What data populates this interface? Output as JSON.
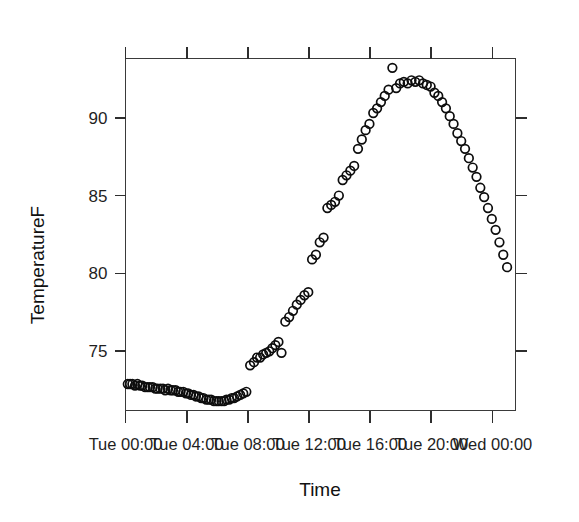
{
  "chart_data": {
    "type": "scatter",
    "title": "",
    "xlabel": "Time",
    "ylabel": "TemperatureF",
    "grid": false,
    "legend": null,
    "marker": "open-circle",
    "xlim": [
      0,
      25.5
    ],
    "ylim": [
      71.2,
      93.8
    ],
    "ytick_values": [
      75,
      80,
      85,
      90
    ],
    "ytick_labels": [
      "75",
      "80",
      "85",
      "90"
    ],
    "xtick_values": [
      0,
      4,
      8,
      12,
      16,
      20,
      24
    ],
    "xtick_labels": [
      "Tue 00:00",
      "Tue 04:00",
      "Tue 08:00",
      "Tue 12:00",
      "Tue 16:00",
      "Tue 20:00",
      "Wed 00:00"
    ],
    "x_units": "hours since Tue 00:00",
    "y_units": "degrees Fahrenheit",
    "x": [
      0.15,
      0.3,
      0.45,
      0.62,
      0.78,
      0.95,
      1.1,
      1.28,
      1.45,
      1.6,
      1.78,
      1.95,
      2.1,
      2.28,
      2.45,
      2.6,
      2.78,
      2.95,
      3.1,
      3.28,
      3.45,
      3.6,
      3.78,
      3.95,
      4.1,
      4.28,
      4.45,
      4.6,
      4.78,
      4.95,
      5.1,
      5.28,
      5.45,
      5.6,
      5.78,
      5.95,
      6.1,
      6.28,
      6.45,
      6.6,
      6.78,
      6.95,
      7.1,
      7.3,
      7.5,
      7.7,
      7.9,
      8.15,
      8.4,
      8.6,
      8.8,
      9.0,
      9.2,
      9.4,
      9.6,
      9.8,
      10.0,
      10.2,
      10.45,
      10.7,
      10.95,
      11.2,
      11.45,
      11.7,
      11.95,
      12.2,
      12.45,
      12.7,
      12.95,
      13.2,
      13.45,
      13.7,
      13.95,
      14.2,
      14.45,
      14.7,
      14.95,
      15.2,
      15.45,
      15.7,
      15.95,
      16.2,
      16.45,
      16.7,
      16.95,
      17.2,
      17.45,
      17.7,
      17.95,
      18.2,
      18.45,
      18.7,
      18.95,
      19.2,
      19.45,
      19.7,
      19.95,
      20.2,
      20.45,
      20.7,
      20.95,
      21.2,
      21.45,
      21.7,
      21.95,
      22.2,
      22.45,
      22.7,
      22.95,
      23.2,
      23.45,
      23.7,
      23.95,
      24.2,
      24.45,
      24.7,
      24.95
    ],
    "y": [
      72.9,
      72.9,
      72.9,
      72.8,
      72.9,
      72.8,
      72.8,
      72.7,
      72.7,
      72.7,
      72.7,
      72.6,
      72.6,
      72.6,
      72.6,
      72.5,
      72.6,
      72.5,
      72.5,
      72.5,
      72.4,
      72.4,
      72.4,
      72.3,
      72.3,
      72.2,
      72.2,
      72.1,
      72.1,
      72.0,
      72.0,
      71.9,
      71.9,
      71.9,
      71.8,
      71.8,
      71.8,
      71.8,
      71.8,
      71.9,
      71.9,
      72.0,
      72.0,
      72.1,
      72.2,
      72.3,
      72.4,
      74.1,
      74.3,
      74.6,
      74.6,
      74.8,
      74.9,
      75.0,
      75.2,
      75.4,
      75.6,
      74.9,
      76.9,
      77.2,
      77.6,
      78.0,
      78.3,
      78.6,
      78.8,
      80.9,
      81.2,
      82.0,
      82.3,
      84.2,
      84.4,
      84.6,
      85.0,
      86.0,
      86.3,
      86.6,
      86.9,
      88.0,
      88.6,
      89.2,
      89.6,
      90.3,
      90.6,
      91.0,
      91.4,
      91.8,
      93.2,
      91.9,
      92.2,
      92.3,
      92.2,
      92.4,
      92.3,
      92.4,
      92.2,
      92.1,
      92.0,
      91.6,
      91.4,
      91.0,
      90.6,
      90.1,
      89.6,
      89.0,
      88.5,
      88.0,
      87.4,
      86.8,
      86.2,
      85.5,
      84.9,
      84.2,
      83.5,
      82.8,
      82.0,
      81.2,
      80.4,
      79.9
    ],
    "x_extra": [
      25.1
    ],
    "y_min_observed": 71.8,
    "y_max_observed": 93.2,
    "n_points": 117
  },
  "axes": {
    "y_title": "TemperatureF",
    "x_title": "Time"
  }
}
